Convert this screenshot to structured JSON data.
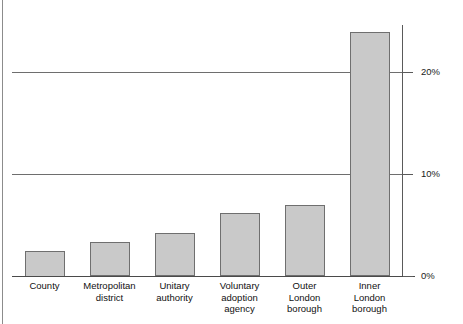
{
  "chart_data": {
    "type": "bar",
    "title": "",
    "subtitle": "",
    "xlabel": "",
    "ylabel": "",
    "categories": [
      "County",
      "Metropolitan district",
      "Unitary authority",
      "Voluntary adoption agency",
      "Outer London borough",
      "Inner London borough"
    ],
    "category_label_lines": [
      [
        "County"
      ],
      [
        "Metropolitan",
        "district"
      ],
      [
        "Unitary",
        "authority"
      ],
      [
        "Voluntary",
        "adoption",
        "agency"
      ],
      [
        "Outer",
        "London",
        "borough"
      ],
      [
        "Inner",
        "London",
        "borough"
      ]
    ],
    "values": [
      2.5,
      3.3,
      4.2,
      6.2,
      7.0,
      23.9
    ],
    "value_unit": "%",
    "ylim": [
      0,
      26
    ],
    "yticks": [
      0,
      10,
      20
    ],
    "ytick_labels": [
      "0%",
      "10%",
      "20%"
    ],
    "grid": true,
    "gridlines_at": [
      10,
      20
    ],
    "legend": null,
    "legend_position": "none",
    "annotations": [],
    "colors": {
      "bar_fill": "#c9c9c9",
      "bar_border": "#6f6f6f",
      "gridline": "#6e6e6e",
      "axis": "#4a4a4a",
      "text": "#111111",
      "background": "#ffffff"
    }
  },
  "axis": {
    "y_ticks": [
      {
        "label": "0%",
        "value": 0
      },
      {
        "label": "10%",
        "value": 10
      },
      {
        "label": "20%",
        "value": 20
      }
    ]
  }
}
